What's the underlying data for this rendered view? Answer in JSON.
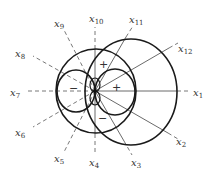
{
  "diagram": {
    "center": {
      "x": 95,
      "y": 91
    },
    "axes": [
      {
        "label": "x",
        "sub": "1",
        "angle": 0,
        "label_pos": [
          193,
          96
        ]
      },
      {
        "label": "x",
        "sub": "12",
        "angle": 30,
        "label_pos": [
          178,
          52
        ]
      },
      {
        "label": "x",
        "sub": "11",
        "angle": 60,
        "label_pos": [
          129,
          23
        ]
      },
      {
        "label": "x",
        "sub": "10",
        "angle": 90,
        "label_pos": [
          89,
          22
        ]
      },
      {
        "label": "x",
        "sub": "9",
        "angle": 120,
        "label_pos": [
          54,
          27
        ]
      },
      {
        "label": "x",
        "sub": "8",
        "angle": 150,
        "label_pos": [
          15,
          57
        ]
      },
      {
        "label": "x",
        "sub": "7",
        "angle": 180,
        "label_pos": [
          10,
          96
        ]
      },
      {
        "label": "x",
        "sub": "6",
        "angle": 210,
        "label_pos": [
          15,
          136
        ]
      },
      {
        "label": "x",
        "sub": "5",
        "angle": 240,
        "label_pos": [
          54,
          162
        ]
      },
      {
        "label": "x",
        "sub": "4",
        "angle": 270,
        "label_pos": [
          89,
          166
        ]
      },
      {
        "label": "x",
        "sub": "3",
        "angle": 300,
        "label_pos": [
          131,
          166
        ]
      },
      {
        "label": "x",
        "sub": "2",
        "angle": 330,
        "label_pos": [
          176,
          145
        ]
      }
    ],
    "circles": [
      {
        "name": "large-right-circle",
        "cx": 131,
        "cy": 92,
        "rx": 46,
        "ry": 53
      },
      {
        "name": "medium-center-circle",
        "cx": 96,
        "cy": 91,
        "rx": 40,
        "ry": 42
      },
      {
        "name": "small-left-circle",
        "cx": 76,
        "cy": 91,
        "rx": 19,
        "ry": 21
      },
      {
        "name": "small-right-circle",
        "cx": 115,
        "cy": 92,
        "rx": 20,
        "ry": 23
      },
      {
        "name": "tiny-upper-petal",
        "cx": 95,
        "cy": 85,
        "rx": 5,
        "ry": 7
      },
      {
        "name": "tiny-lower-petal",
        "cx": 95,
        "cy": 98,
        "rx": 5,
        "ry": 7
      }
    ],
    "signs": [
      {
        "text": "+",
        "x": 99,
        "y": 68
      },
      {
        "text": "+",
        "x": 112,
        "y": 91
      },
      {
        "text": "−",
        "x": 69,
        "y": 92
      },
      {
        "text": "−",
        "x": 98,
        "y": 122
      }
    ]
  }
}
